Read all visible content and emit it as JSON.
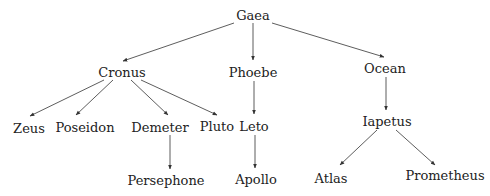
{
  "diagram": {
    "type": "family-tree",
    "nodes": [
      {
        "id": "gaea",
        "label": "Gaea",
        "x": 253,
        "y": 15
      },
      {
        "id": "cronus",
        "label": "Cronus",
        "x": 122,
        "y": 72
      },
      {
        "id": "phoebe",
        "label": "Phoebe",
        "x": 253,
        "y": 72
      },
      {
        "id": "ocean",
        "label": "Ocean",
        "x": 385,
        "y": 68
      },
      {
        "id": "zeus",
        "label": "Zeus",
        "x": 29,
        "y": 128
      },
      {
        "id": "poseidon",
        "label": "Poseidon",
        "x": 85,
        "y": 127
      },
      {
        "id": "demeter",
        "label": "Demeter",
        "x": 160,
        "y": 127
      },
      {
        "id": "pluto",
        "label": "Pluto",
        "x": 217,
        "y": 126
      },
      {
        "id": "leto",
        "label": "Leto",
        "x": 254,
        "y": 126
      },
      {
        "id": "iapetus",
        "label": "Iapetus",
        "x": 387,
        "y": 121
      },
      {
        "id": "persephone",
        "label": "Persephone",
        "x": 166,
        "y": 180
      },
      {
        "id": "apollo",
        "label": "Apollo",
        "x": 256,
        "y": 179
      },
      {
        "id": "atlas",
        "label": "Atlas",
        "x": 331,
        "y": 178
      },
      {
        "id": "prometheus",
        "label": "Prometheus",
        "x": 445,
        "y": 175
      }
    ],
    "edges": [
      {
        "from": "gaea",
        "to": "cronus",
        "x1": 234,
        "y1": 23,
        "x2": 123,
        "y2": 61
      },
      {
        "from": "gaea",
        "to": "phoebe",
        "x1": 253,
        "y1": 23,
        "x2": 253,
        "y2": 60
      },
      {
        "from": "gaea",
        "to": "ocean",
        "x1": 272,
        "y1": 23,
        "x2": 384,
        "y2": 57
      },
      {
        "from": "cronus",
        "to": "zeus",
        "x1": 104,
        "y1": 80,
        "x2": 30,
        "y2": 116
      },
      {
        "from": "cronus",
        "to": "poseidon",
        "x1": 113,
        "y1": 80,
        "x2": 76,
        "y2": 115
      },
      {
        "from": "cronus",
        "to": "demeter",
        "x1": 131,
        "y1": 80,
        "x2": 168,
        "y2": 115
      },
      {
        "from": "cronus",
        "to": "pluto",
        "x1": 141,
        "y1": 80,
        "x2": 217,
        "y2": 115
      },
      {
        "from": "phoebe",
        "to": "leto",
        "x1": 254,
        "y1": 81,
        "x2": 254,
        "y2": 114
      },
      {
        "from": "ocean",
        "to": "iapetus",
        "x1": 386,
        "y1": 77,
        "x2": 386,
        "y2": 110
      },
      {
        "from": "demeter",
        "to": "persephone",
        "x1": 170,
        "y1": 135,
        "x2": 170,
        "y2": 169
      },
      {
        "from": "leto",
        "to": "apollo",
        "x1": 255,
        "y1": 135,
        "x2": 255,
        "y2": 168
      },
      {
        "from": "iapetus",
        "to": "atlas",
        "x1": 377,
        "y1": 130,
        "x2": 340,
        "y2": 165
      },
      {
        "from": "iapetus",
        "to": "prometheus",
        "x1": 396,
        "y1": 130,
        "x2": 435,
        "y2": 165
      }
    ],
    "colors": {
      "text": "#222222",
      "edge": "#333333",
      "background": "#ffffff"
    }
  }
}
